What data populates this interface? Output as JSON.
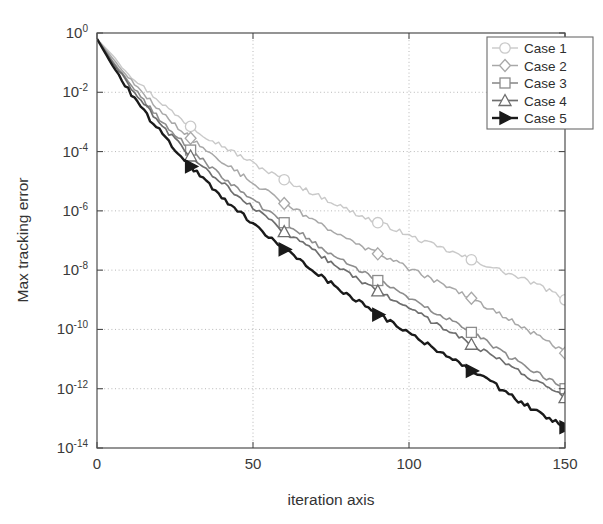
{
  "chart_data": {
    "type": "line",
    "title": "",
    "xlabel": "iteration axis",
    "ylabel": "Max tracking error",
    "xlim": [
      0,
      150
    ],
    "ylim": [
      1e-14,
      1
    ],
    "yscale": "log",
    "xscale": "linear",
    "grid": true,
    "grid_style": "dotted",
    "legend_position": "top-right",
    "xticks": [
      0,
      50,
      100,
      150
    ],
    "xtick_labels": [
      "0",
      "50",
      "100",
      "150"
    ],
    "yticks": [
      1,
      0.01,
      0.0001,
      1e-06,
      1e-08,
      1e-10,
      1e-12,
      1e-14
    ],
    "ytick_labels": [
      "10^0",
      "10^-2",
      "10^-4",
      "10^-6",
      "10^-8",
      "10^-10",
      "10^-12",
      "10^-14"
    ],
    "ytick_mantissa": "10",
    "ytick_exponents": [
      "0",
      "-2",
      "-4",
      "-6",
      "-8",
      "-10",
      "-12",
      "-14"
    ],
    "marker_iterations": [
      30,
      60,
      90,
      120,
      150
    ],
    "x": [
      0,
      5,
      10,
      15,
      20,
      25,
      30,
      35,
      40,
      45,
      50,
      55,
      60,
      65,
      70,
      75,
      80,
      85,
      90,
      95,
      100,
      105,
      110,
      115,
      120,
      125,
      130,
      135,
      140,
      145,
      150
    ],
    "series": [
      {
        "name": "Case 1",
        "label": "Case 1",
        "marker": "circle",
        "marker_filled": false,
        "color": "#c9c9c9",
        "linewidth": 1.4,
        "log10_values": [
          -0.2,
          -0.75,
          -1.35,
          -1.85,
          -2.3,
          -2.75,
          -3.15,
          -3.5,
          -3.8,
          -4.1,
          -4.4,
          -4.7,
          -4.95,
          -5.2,
          -5.45,
          -5.7,
          -5.95,
          -6.2,
          -6.4,
          -6.6,
          -6.85,
          -7.05,
          -7.25,
          -7.45,
          -7.65,
          -7.85,
          -8.05,
          -8.25,
          -8.45,
          -8.7,
          -9.0
        ],
        "endpoint_iteration": 150,
        "endpoint_log10": -9.0
      },
      {
        "name": "Case 2",
        "label": "Case 2",
        "marker": "diamond",
        "marker_filled": false,
        "color": "#a8a8a8",
        "linewidth": 1.5,
        "log10_values": [
          -0.2,
          -0.85,
          -1.5,
          -2.05,
          -2.6,
          -3.1,
          -3.55,
          -3.95,
          -4.35,
          -4.7,
          -5.05,
          -5.4,
          -5.75,
          -6.05,
          -6.35,
          -6.65,
          -6.95,
          -7.2,
          -7.45,
          -7.7,
          -7.95,
          -8.2,
          -8.45,
          -8.7,
          -8.95,
          -9.25,
          -9.55,
          -9.85,
          -10.15,
          -10.45,
          -10.8
        ]
      },
      {
        "name": "Case 3",
        "label": "Case 3",
        "marker": "square",
        "marker_filled": false,
        "color": "#8d8d8d",
        "linewidth": 1.6,
        "log10_values": [
          -0.2,
          -0.95,
          -1.65,
          -2.3,
          -2.9,
          -3.45,
          -3.95,
          -4.4,
          -4.85,
          -5.25,
          -5.65,
          -6.05,
          -6.4,
          -6.75,
          -7.1,
          -7.45,
          -7.75,
          -8.05,
          -8.35,
          -8.65,
          -8.95,
          -9.25,
          -9.55,
          -9.8,
          -10.1,
          -10.45,
          -10.8,
          -11.1,
          -11.4,
          -11.7,
          -12.0
        ]
      },
      {
        "name": "Case 4",
        "label": "Case 4",
        "marker": "triangle-up",
        "marker_filled": false,
        "color": "#6e6e6e",
        "linewidth": 1.7,
        "log10_values": [
          -0.2,
          -1.0,
          -1.75,
          -2.4,
          -3.05,
          -3.6,
          -4.15,
          -4.6,
          -5.05,
          -5.5,
          -5.9,
          -6.3,
          -6.7,
          -7.05,
          -7.4,
          -7.75,
          -8.1,
          -8.4,
          -8.7,
          -9.0,
          -9.3,
          -9.6,
          -9.9,
          -10.2,
          -10.5,
          -10.8,
          -11.1,
          -11.4,
          -11.7,
          -12.0,
          -12.3
        ]
      },
      {
        "name": "Case 5",
        "label": "Case 5",
        "marker": "triangle-right",
        "marker_filled": true,
        "color": "#1a1a1a",
        "linewidth": 2.4,
        "log10_values": [
          -0.2,
          -1.1,
          -1.9,
          -2.65,
          -3.3,
          -3.95,
          -4.5,
          -5.05,
          -5.55,
          -6.0,
          -6.45,
          -6.9,
          -7.3,
          -7.7,
          -8.05,
          -8.45,
          -8.8,
          -9.15,
          -9.5,
          -9.8,
          -10.15,
          -10.45,
          -10.8,
          -11.1,
          -11.4,
          -11.7,
          -12.05,
          -12.4,
          -12.7,
          -13.0,
          -13.3
        ]
      }
    ]
  },
  "axes": {
    "frame_color": "#4d4d4d",
    "grid_color": "#b0b0b0",
    "background": "#ffffff"
  },
  "legend": {
    "border_color": "#6b6b6b",
    "background": "#ffffff"
  }
}
